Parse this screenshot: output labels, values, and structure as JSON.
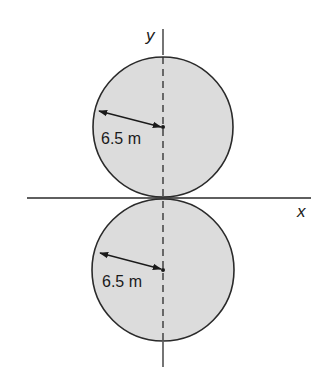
{
  "figure": {
    "axes": {
      "x_label": "x",
      "y_label": "y"
    },
    "circles": [
      {
        "id": "upper",
        "radius_label": "6.5 m",
        "fill": "#dcdcdc",
        "stroke": "#2a2a2a"
      },
      {
        "id": "lower",
        "radius_label": "6.5 m",
        "fill": "#dcdcdc",
        "stroke": "#2a2a2a"
      }
    ]
  }
}
